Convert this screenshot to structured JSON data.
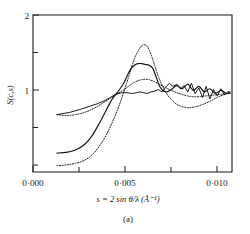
{
  "figure": {
    "panel_label": "(a)",
    "y_axis_label": "S(c,s)",
    "x_axis_title": "s = 2 sin θ/λ (Å⁻¹)",
    "x_tick_labels": [
      "0·000",
      "0·005",
      "0·010"
    ],
    "y_tick_labels": [
      "2",
      "1"
    ],
    "ink_color": "#111111"
  },
  "chart_data": {
    "type": "line",
    "title": "",
    "subtitle": "",
    "panel": "(a)",
    "xlabel": "s = 2 sin θ/λ (Å⁻¹)",
    "ylabel": "S(c,s)",
    "xlim": [
      0.0,
      0.0108
    ],
    "ylim": [
      0.0,
      2.0
    ],
    "x_ticks": [
      0.0,
      0.0025,
      0.005,
      0.0075,
      0.01
    ],
    "x_tick_labels": [
      "0·000",
      "",
      "0·005",
      "",
      "0·010"
    ],
    "y_ticks": [
      0.0,
      0.5,
      1.0,
      1.5,
      2.0
    ],
    "y_tick_labels": [
      "",
      "",
      "1",
      "",
      "2"
    ],
    "grid": false,
    "legend": "none",
    "series": [
      {
        "name": "curve-1-dotted-tall-peak",
        "style": "dotted",
        "x": [
          0.0013,
          0.0018,
          0.0023,
          0.0028,
          0.0033,
          0.0038,
          0.0042,
          0.0046,
          0.0049,
          0.0052,
          0.0055,
          0.0058,
          0.006,
          0.0062,
          0.0064,
          0.0066,
          0.0068,
          0.0071,
          0.0074,
          0.0077,
          0.008,
          0.0084,
          0.0088,
          0.0092,
          0.0096,
          0.01,
          0.0104,
          0.0107
        ],
        "y": [
          0.08,
          0.09,
          0.11,
          0.15,
          0.24,
          0.4,
          0.58,
          0.8,
          1.0,
          1.22,
          1.44,
          1.58,
          1.62,
          1.6,
          1.5,
          1.36,
          1.22,
          1.06,
          0.95,
          0.88,
          0.84,
          0.82,
          0.83,
          0.86,
          0.9,
          0.95,
          0.99,
          1.01
        ]
      },
      {
        "name": "curve-2-solid-flat-top-peak",
        "style": "solid",
        "x": [
          0.0013,
          0.0018,
          0.0023,
          0.0028,
          0.0032,
          0.0036,
          0.004,
          0.0043,
          0.0046,
          0.0049,
          0.0051,
          0.0053,
          0.0055,
          0.0057,
          0.0059,
          0.0061,
          0.0063,
          0.0065,
          0.0067,
          0.0069,
          0.0072,
          0.0075,
          0.0078,
          0.0081,
          0.0084,
          0.0087,
          0.009,
          0.0093,
          0.0096,
          0.0099,
          0.0102,
          0.0105,
          0.0107
        ],
        "y": [
          0.24,
          0.25,
          0.28,
          0.35,
          0.46,
          0.62,
          0.8,
          0.93,
          1.02,
          1.12,
          1.22,
          1.31,
          1.36,
          1.38,
          1.38,
          1.37,
          1.36,
          1.32,
          1.2,
          1.08,
          1.02,
          1.05,
          1.1,
          1.06,
          1.12,
          1.04,
          1.09,
          1.02,
          1.06,
          1.0,
          1.04,
          1.0,
          1.02
        ]
      },
      {
        "name": "curve-3-dotted-low-broad",
        "style": "dotted",
        "x": [
          0.0013,
          0.0018,
          0.0023,
          0.0028,
          0.0033,
          0.0038,
          0.0042,
          0.0046,
          0.005,
          0.0054,
          0.0058,
          0.0062,
          0.0066,
          0.007,
          0.0074,
          0.0078,
          0.0082,
          0.0086,
          0.009,
          0.0094,
          0.0098,
          0.0102,
          0.0107
        ],
        "y": [
          0.73,
          0.72,
          0.73,
          0.76,
          0.81,
          0.88,
          0.94,
          1.0,
          1.06,
          1.13,
          1.17,
          1.18,
          1.15,
          1.1,
          1.05,
          1.01,
          0.98,
          0.96,
          0.96,
          0.97,
          0.98,
          0.99,
          1.0
        ]
      },
      {
        "name": "curve-4-solid-noisy-experimental",
        "style": "solid-noisy",
        "x": [
          0.0013,
          0.002,
          0.0026,
          0.0031,
          0.0035,
          0.0039,
          0.0042,
          0.0045,
          0.0048,
          0.0051,
          0.0054,
          0.0056,
          0.0058,
          0.006,
          0.0062,
          0.0064,
          0.0066,
          0.0068,
          0.007,
          0.0072,
          0.0074,
          0.0076,
          0.0078,
          0.008,
          0.0082,
          0.0084,
          0.0086,
          0.0088,
          0.009,
          0.0092,
          0.0094,
          0.0096,
          0.0098,
          0.01,
          0.0102,
          0.0104,
          0.0106,
          0.0107
        ],
        "y": [
          0.73,
          0.76,
          0.8,
          0.84,
          0.87,
          0.91,
          0.95,
          0.99,
          1.01,
          1.01,
          1.0,
          1.01,
          1.02,
          1.01,
          1.0,
          1.02,
          1.03,
          1.05,
          1.02,
          1.08,
          1.13,
          1.09,
          1.12,
          1.06,
          1.1,
          1.02,
          1.13,
          1.0,
          1.07,
          0.95,
          1.09,
          0.93,
          1.05,
          0.97,
          1.06,
          0.98,
          1.03,
          1.0
        ]
      }
    ]
  }
}
